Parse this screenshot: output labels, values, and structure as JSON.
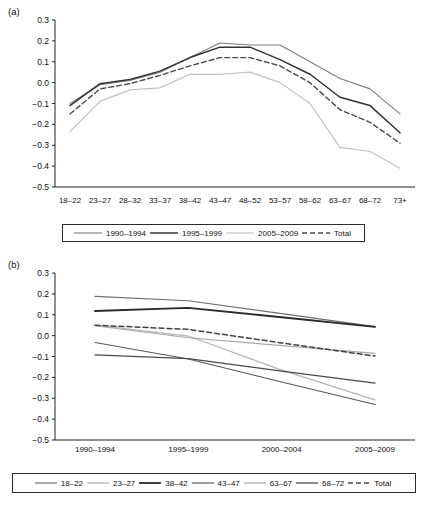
{
  "figure": {
    "panels": [
      {
        "label": "(a)"
      },
      {
        "label": "(b)"
      }
    ]
  },
  "chart_data": [
    {
      "id": "panel-a",
      "type": "line",
      "title": "(a)",
      "xlabel": "",
      "ylabel": "",
      "ylim": [
        -0.5,
        0.3
      ],
      "yticks": [
        "0.3",
        "0.2",
        "0.1",
        "0.0",
        "-0.1",
        "-0.2",
        "-0.3",
        "-0.4",
        "-0.5"
      ],
      "ytick_values": [
        0.3,
        0.2,
        0.1,
        0.0,
        -0.1,
        -0.2,
        -0.3,
        -0.4,
        -0.5
      ],
      "grid": false,
      "legend_position": "bottom",
      "categories": [
        "18-22",
        "23-27",
        "28-32",
        "33-37",
        "38-42",
        "43-47",
        "48-52",
        "53-57",
        "58-62",
        "63-67",
        "68-72",
        "73+"
      ],
      "series": [
        {
          "name": "1990-1994",
          "color": "#7d7d7d",
          "dash": "none",
          "width": 1.1,
          "values": [
            -0.1,
            -0.01,
            0.01,
            0.05,
            0.12,
            0.19,
            0.18,
            0.18,
            0.1,
            0.02,
            -0.03,
            -0.15
          ]
        },
        {
          "name": "1995-1999",
          "color": "#333333",
          "dash": "none",
          "width": 1.5,
          "values": [
            -0.11,
            -0.005,
            0.015,
            0.055,
            0.12,
            0.17,
            0.17,
            0.11,
            0.04,
            -0.07,
            -0.11,
            -0.24
          ]
        },
        {
          "name": "2005-2009",
          "color": "#c2c2c2",
          "dash": "none",
          "width": 1.2,
          "values": [
            -0.235,
            -0.09,
            -0.035,
            -0.025,
            0.04,
            0.04,
            0.05,
            0.0,
            -0.1,
            -0.31,
            -0.33,
            -0.41
          ]
        },
        {
          "name": "Total",
          "color": "#4a4a4a",
          "dash": "5,3",
          "width": 1.4,
          "values": [
            -0.15,
            -0.03,
            -0.005,
            0.035,
            0.08,
            0.12,
            0.12,
            0.08,
            0.0,
            -0.13,
            -0.19,
            -0.29
          ]
        }
      ]
    },
    {
      "id": "panel-b",
      "type": "line",
      "title": "(b)",
      "xlabel": "",
      "ylabel": "",
      "ylim": [
        -0.5,
        0.3
      ],
      "yticks": [
        "0.3",
        "0.2",
        "0.1",
        "0.0",
        "-0.1",
        "-0.2",
        "-0.3",
        "-0.4",
        "-0.5"
      ],
      "ytick_values": [
        0.3,
        0.2,
        0.1,
        0.0,
        -0.1,
        -0.2,
        -0.3,
        -0.4,
        -0.5
      ],
      "grid": false,
      "legend_position": "bottom",
      "categories": [
        "1990-1994",
        "1995-1999",
        "2000-2004",
        "2005-2009"
      ],
      "series": [
        {
          "name": "18-22",
          "color": "#6e6e6e",
          "dash": "none",
          "width": 1.2,
          "values": [
            0.188,
            0.167,
            0.105,
            0.043
          ]
        },
        {
          "name": "23-27",
          "color": "#b4b4b4",
          "dash": "none",
          "width": 1.2,
          "values": [
            0.05,
            -0.002,
            -0.165,
            -0.308
          ]
        },
        {
          "name": "38-42",
          "color": "#2b2b2b",
          "dash": "none",
          "width": 1.8,
          "values": [
            0.118,
            0.133,
            0.088,
            0.042
          ]
        },
        {
          "name": "43-47",
          "color": "#5a5a5a",
          "dash": "none",
          "width": 1.2,
          "values": [
            -0.033,
            -0.112,
            -0.222,
            -0.33
          ]
        },
        {
          "name": "63-67",
          "color": "#a8a8a8",
          "dash": "none",
          "width": 1.1,
          "values": [
            0.047,
            -0.01,
            -0.048,
            -0.085
          ]
        },
        {
          "name": "68-72",
          "color": "#4a4a4a",
          "dash": "none",
          "width": 1.3,
          "values": [
            -0.092,
            -0.11,
            -0.17,
            -0.228
          ]
        },
        {
          "name": "Total",
          "color": "#444444",
          "dash": "5,3",
          "width": 1.5,
          "values": [
            0.05,
            0.03,
            -0.035,
            -0.098
          ]
        }
      ]
    }
  ]
}
